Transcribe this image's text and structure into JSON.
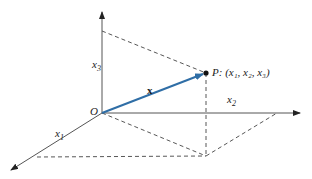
{
  "diagram": {
    "type": "3d-coordinate-vector",
    "colors": {
      "axis": "#555555",
      "dashed": "#444444",
      "vector": "#2f6ea6",
      "point": "#111111"
    },
    "labels": {
      "x1": "x",
      "x1_sub": "1",
      "x2": "x",
      "x2_sub": "2",
      "x3": "x",
      "x3_sub": "3",
      "origin": "O",
      "vector": "x",
      "point": "P",
      "point_coords": ": (x₁, x₂, x₃)"
    }
  }
}
